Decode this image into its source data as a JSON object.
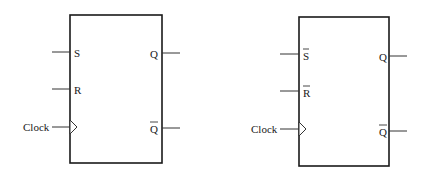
{
  "diagram": {
    "type": "flip-flop block symbols",
    "flipflops": [
      {
        "id": "sr-ff",
        "inputs": [
          {
            "label": "S",
            "overbar": false
          },
          {
            "label": "R",
            "overbar": false
          }
        ],
        "clock_label": "Clock",
        "outputs": [
          {
            "label": "Q",
            "overbar": false
          },
          {
            "label": "Q",
            "overbar": true
          }
        ]
      },
      {
        "id": "sr-ff-active-low",
        "inputs": [
          {
            "label": "S",
            "overbar": true
          },
          {
            "label": "R",
            "overbar": true
          }
        ],
        "clock_label": "Clock",
        "outputs": [
          {
            "label": "Q",
            "overbar": false
          },
          {
            "label": "Q",
            "overbar": true
          }
        ]
      }
    ],
    "colors": {
      "line": "#1a1a1a",
      "background": "#ffffff"
    }
  }
}
